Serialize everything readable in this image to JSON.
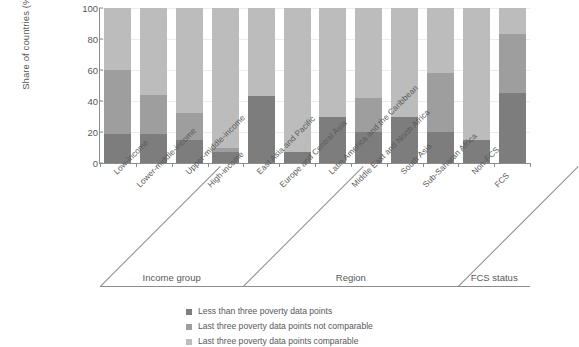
{
  "chart_data": {
    "type": "bar",
    "title": "",
    "subtitle": "",
    "stacked": true,
    "orientation": "vertical",
    "xlabel": "",
    "ylabel": "Share of countries (%)",
    "ylim": [
      0,
      100
    ],
    "yticks": [
      0,
      20,
      40,
      60,
      80,
      100
    ],
    "ytick_labels": [
      "0",
      "20",
      "40",
      "60",
      "80",
      "100"
    ],
    "grid": true,
    "grid_axis": "y",
    "legend_position": "bottom-center",
    "categories": [
      "Low-income",
      "Lower-middle-income",
      "Upper-middle-income",
      "High-income",
      "East Asia and Pacific",
      "Europe and Central Asia",
      "Latin America and the Caribbean",
      "Middle East and North Africa",
      "South Asia",
      "Sub-Saharan Africa",
      "Non-FCS",
      "FCS"
    ],
    "series": [
      {
        "name": "Last three poverty data points comparable",
        "color": "#bcbcbc",
        "values": [
          40,
          56,
          68,
          90,
          57,
          93,
          70,
          58,
          70,
          42,
          85,
          17
        ]
      },
      {
        "name": "Last three poverty data points not comparable",
        "color": "#9e9e9e",
        "values": [
          41,
          25,
          17,
          3,
          0,
          0,
          0,
          22,
          0,
          38,
          0,
          38
        ]
      },
      {
        "name": "Less than three poverty data points",
        "color": "#7d7d7d",
        "values": [
          19,
          19,
          15,
          7,
          43,
          7,
          30,
          20,
          30,
          20,
          15,
          45
        ]
      }
    ],
    "groups": [
      {
        "label": "Income group",
        "categories": [
          "Low-income",
          "Lower-middle-income",
          "Upper-middle-income",
          "High-income"
        ]
      },
      {
        "label": "Region",
        "categories": [
          "East Asia and Pacific",
          "Europe and Central Asia",
          "Latin America and the Caribbean",
          "Middle East and North Africa",
          "South Asia",
          "Sub-Saharan Africa"
        ]
      },
      {
        "label": "FCS status",
        "categories": [
          "Non-FCS",
          "FCS"
        ]
      }
    ]
  },
  "axis": {
    "y_label": "Share of countries (%)",
    "y_ticks": [
      "100",
      "80",
      "60",
      "40",
      "20",
      "0"
    ]
  },
  "categories": [
    "Low-income",
    "Lower-middle-income",
    "Upper-middle-income",
    "High-income",
    "East Asia and Pacific",
    "Europe and Central Asia",
    "Latin America and the Caribbean",
    "Middle East and North Africa",
    "South Asia",
    "Sub-Saharan Africa",
    "Non-FCS",
    "FCS"
  ],
  "groups": [
    {
      "label": "Income group"
    },
    {
      "label": "Region"
    },
    {
      "label": "FCS status"
    }
  ],
  "legend": {
    "items": [
      {
        "label": "Less than three poverty data points",
        "color": "#7d7d7d"
      },
      {
        "label": "Last three poverty data points not comparable",
        "color": "#9e9e9e"
      },
      {
        "label": "Last three poverty data points comparable",
        "color": "#bcbcbc"
      }
    ]
  }
}
